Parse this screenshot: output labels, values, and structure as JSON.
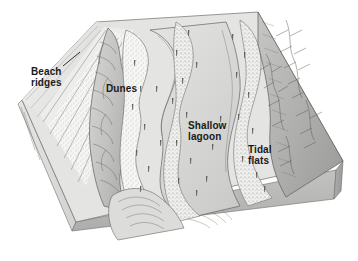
{
  "figure": {
    "type": "block-diagram",
    "background_color": "#ffffff",
    "line_color": "#4a4a4a",
    "label_color": "#1a1a1a"
  },
  "labels": {
    "beach_ridges": "Beach\nridges",
    "dunes": "Dunes",
    "shallow_lagoon": "Shallow\nlagoon",
    "tidal_flats": "Tidal\nflats"
  },
  "surfaces": {
    "ocean_water": {
      "name": "ocean-water-surface",
      "color": "#e8e8e8"
    },
    "beach_sand": {
      "name": "beach-sand-strip",
      "color": "#f2f2f0"
    },
    "beach_ridge_plain": {
      "name": "beach-ridge-plain",
      "color": "#dcdcda"
    },
    "dune_ridge": {
      "name": "dune-ridge",
      "color": "#c9c9c7"
    },
    "lagoon_water": {
      "name": "lagoon-water",
      "color": "#d5d5d3"
    },
    "marsh_stipple": {
      "name": "marsh-stipple-area",
      "color": "#f4f4f2"
    },
    "tidal_flat": {
      "name": "tidal-flat-area",
      "color": "#bdbdbb"
    },
    "mainland_upland": {
      "name": "mainland-upland",
      "color": "#b3b3b1"
    },
    "block_front_face": {
      "name": "block-front-face",
      "color": "#b8b8b6"
    },
    "block_left_face": {
      "name": "block-left-face",
      "color": "#dadad8"
    },
    "block_right_face": {
      "name": "block-right-face",
      "color": "#a8a8a6"
    },
    "strata_band": {
      "name": "strata-band",
      "color": "#cfcfcd"
    }
  }
}
